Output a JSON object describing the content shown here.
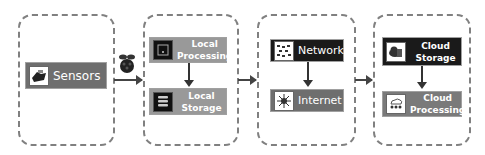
{
  "panels": [
    {
      "name": "sensing"
    },
    {
      "name": "local"
    },
    {
      "name": "network"
    },
    {
      "name": "cloud"
    }
  ],
  "nodes": {
    "sensors": {
      "label": "Sensors",
      "icon": "sensor-icon",
      "color": "#6e6e6e"
    },
    "local_processing": {
      "label1": "Local",
      "label2": "Processing",
      "icon": "cpu-icon",
      "color": "#999999"
    },
    "local_storage": {
      "label1": "Local",
      "label2": "Storage",
      "icon": "database-icon",
      "color": "#999999"
    },
    "network": {
      "label": "Network",
      "icon": "network-icon",
      "color": "#1a1a1a"
    },
    "internet": {
      "label": "Internet",
      "icon": "globe-icon",
      "color": "#6e6e6e"
    },
    "cloud_storage": {
      "label1": "Cloud",
      "label2": "Storage",
      "icon": "cloud-server-icon",
      "color": "#1a1a1a"
    },
    "cloud_processing": {
      "label1": "Cloud",
      "label2": "Processing",
      "icon": "cloud-users-icon",
      "color": "#7a7a7a"
    }
  },
  "connector_icon": "raspberry-pi-icon"
}
